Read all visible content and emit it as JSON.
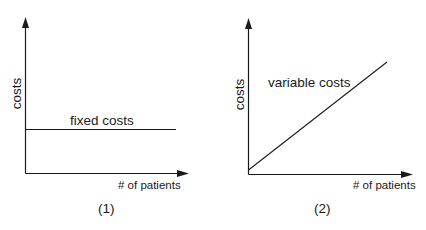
{
  "diagrams": [
    {
      "id": "1",
      "caption": "(1)",
      "y_label": "costs",
      "x_label": "# of patients",
      "line_label": "fixed costs",
      "line_type": "horizontal"
    },
    {
      "id": "2",
      "caption": "(2)",
      "y_label": "costs",
      "x_label": "# of patients",
      "line_label": "variable costs",
      "line_type": "linear-increasing"
    }
  ],
  "colors": {
    "stroke": "#1a1a1a",
    "background": "#ffffff"
  }
}
